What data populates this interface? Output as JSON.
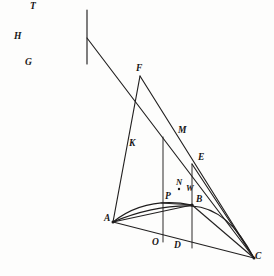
{
  "figure": {
    "canvas": {
      "width": 274,
      "height": 276,
      "background": "#fdfdfc"
    },
    "ink_color": "#1f1d1d",
    "label_color": "#171515"
  },
  "points": [
    {
      "id": "T",
      "label": "T",
      "x": 87,
      "y": 6,
      "label_x": 30,
      "label_y": 2,
      "marked": false
    },
    {
      "id": "H",
      "label": "H",
      "x": 87,
      "y": 38,
      "label_x": 14,
      "label_y": 32,
      "marked": false
    },
    {
      "id": "G",
      "label": "G",
      "x": 87,
      "y": 66,
      "label_x": 25,
      "label_y": 58,
      "marked": false
    },
    {
      "id": "F",
      "label": "F",
      "x": 140,
      "y": 74,
      "label_x": 136,
      "label_y": 64,
      "marked": false
    },
    {
      "id": "K",
      "label": "K",
      "x": 140,
      "y": 148,
      "label_x": 129,
      "label_y": 139,
      "marked": false
    },
    {
      "id": "M",
      "label": "M",
      "x": 163,
      "y": 135,
      "label_x": 178,
      "label_y": 126,
      "marked": false
    },
    {
      "id": "E",
      "label": "E",
      "x": 192,
      "y": 163,
      "label_x": 198,
      "label_y": 153,
      "marked": false
    },
    {
      "id": "N",
      "label": "N",
      "x": 179,
      "y": 189,
      "label_x": 176,
      "label_y": 178,
      "marked": true
    },
    {
      "id": "W",
      "label": "W",
      "x": 186,
      "y": 192,
      "label_x": 186,
      "label_y": 183,
      "marked": false
    },
    {
      "id": "P",
      "label": "P",
      "x": 163,
      "y": 203,
      "label_x": 165,
      "label_y": 192,
      "marked": false
    },
    {
      "id": "B",
      "label": "B",
      "x": 192,
      "y": 205,
      "label_x": 196,
      "label_y": 195,
      "marked": true
    },
    {
      "id": "A",
      "label": "A",
      "x": 113,
      "y": 222,
      "label_x": 106,
      "label_y": 214,
      "marked": true
    },
    {
      "id": "O",
      "label": "O",
      "x": 163,
      "y": 241,
      "label_x": 152,
      "label_y": 237,
      "marked": false
    },
    {
      "id": "D",
      "label": "D",
      "x": 192,
      "y": 247,
      "label_x": 174,
      "label_y": 240,
      "marked": false
    },
    {
      "id": "C",
      "label": "C",
      "x": 254,
      "y": 258,
      "label_x": 255,
      "label_y": 252,
      "marked": true
    }
  ],
  "segments": [
    {
      "name": "segment-T-G",
      "from": "T",
      "to": "G"
    },
    {
      "name": "segment-H-C",
      "from": "H",
      "to": "C"
    },
    {
      "name": "segment-F-A",
      "from": "F",
      "to": "A"
    },
    {
      "name": "segment-F-C",
      "from": "F",
      "to": "C"
    },
    {
      "name": "segment-M-O",
      "from": "M",
      "to": "O"
    },
    {
      "name": "segment-E-D",
      "from": "E",
      "to": "D"
    },
    {
      "name": "segment-E-C",
      "from": "E",
      "to": "C"
    },
    {
      "name": "segment-P-B",
      "from": "P",
      "to": "B"
    },
    {
      "name": "segment-A-C",
      "from": "A",
      "to": "C"
    },
    {
      "name": "segment-A-B",
      "from": "A",
      "to": "B"
    },
    {
      "name": "segment-B-C",
      "from": "B",
      "to": "C"
    }
  ],
  "curves": [
    {
      "name": "curve-A-B-upper",
      "description": "arc through A, P, B"
    },
    {
      "name": "curve-A-B-C",
      "description": "parabolic arc A to B to C"
    }
  ]
}
